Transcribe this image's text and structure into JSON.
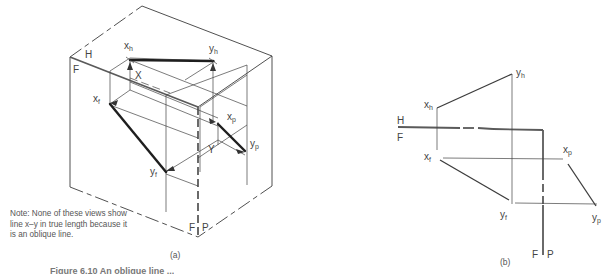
{
  "figure": {
    "view_a": {
      "caption": "(a)",
      "plane_labels": {
        "horizontal": "H",
        "frontal": "F",
        "frontal_bottom": "F",
        "profile": "P"
      },
      "points": {
        "xh": {
          "base": "x",
          "sub": "h"
        },
        "yh": {
          "base": "y",
          "sub": "h"
        },
        "xf": {
          "base": "x",
          "sub": "f"
        },
        "yf": {
          "base": "y",
          "sub": "f"
        },
        "xp": {
          "base": "x",
          "sub": "p"
        },
        "yp": {
          "base": "y",
          "sub": "p"
        },
        "X": "X",
        "Y": "Y"
      },
      "note": "Note: None of these views show line x–y in true length because it is an oblique line."
    },
    "view_b": {
      "caption": "(b)",
      "plane_labels": {
        "horizontal": "H",
        "frontal": "F",
        "frontal_bottom": "F",
        "profile": "P"
      },
      "points": {
        "xh": {
          "base": "x",
          "sub": "h"
        },
        "yh": {
          "base": "y",
          "sub": "h"
        },
        "xf": {
          "base": "x",
          "sub": "f"
        },
        "yf": {
          "base": "y",
          "sub": "f"
        },
        "xp": {
          "base": "x",
          "sub": "p"
        },
        "yp": {
          "base": "y",
          "sub": "p"
        }
      }
    },
    "caption_clipped": "Figure 6.10 An oblique line ..."
  }
}
